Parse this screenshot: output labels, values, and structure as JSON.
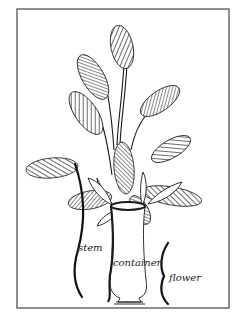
{
  "figure": {
    "labels": {
      "stem": "stem",
      "container": "container",
      "flower": "flower"
    },
    "colors": {
      "ink": "#1a1a1a",
      "frame": "#444444",
      "background": "#ffffff"
    }
  }
}
